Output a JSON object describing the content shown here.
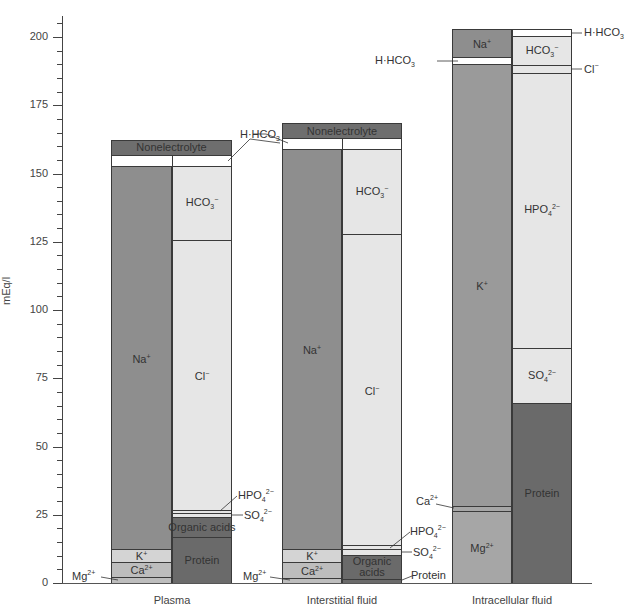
{
  "chart_data": {
    "type": "bar",
    "subtype": "stacked-gamble-diagram",
    "title": "",
    "xlabel": "",
    "ylabel": "mEq/l",
    "ylim": [
      0,
      200
    ],
    "yticks": [
      0,
      25,
      50,
      75,
      100,
      125,
      150,
      175,
      200
    ],
    "minor_tick_step": 5,
    "categories": [
      "Plasma",
      "Interstitial fluid",
      "Intracellular fluid"
    ],
    "columns": [
      {
        "name": "Plasma",
        "top_segments": [
          {
            "name": "Nonelectrolyte",
            "from": 156.8,
            "to": 162.3
          },
          {
            "name": "H·HCO3",
            "from": 152.7,
            "to": 156.8
          }
        ],
        "cations": [
          {
            "name": "Mg2+",
            "from": 0,
            "to": 2.2
          },
          {
            "name": "Ca2+",
            "from": 2.2,
            "to": 7.7
          },
          {
            "name": "K+",
            "from": 7.7,
            "to": 12.5
          },
          {
            "name": "Na+",
            "from": 12.5,
            "to": 152.7
          }
        ],
        "anions": [
          {
            "name": "Protein",
            "from": 0,
            "to": 16.8
          },
          {
            "name": "Organic acids",
            "from": 16.8,
            "to": 24.2
          },
          {
            "name": "SO4 2-",
            "from": 24.2,
            "to": 25.6
          },
          {
            "name": "HPO4 2-",
            "from": 25.6,
            "to": 26.7
          },
          {
            "name": "Cl-",
            "from": 26.7,
            "to": 125.6
          },
          {
            "name": "HCO3-",
            "from": 125.6,
            "to": 152.7
          }
        ]
      },
      {
        "name": "Interstitial fluid",
        "top_segments": [
          {
            "name": "Nonelectrolyte",
            "from": 163.0,
            "to": 168.5
          },
          {
            "name": "H·HCO3",
            "from": 159.0,
            "to": 163.0
          }
        ],
        "cations": [
          {
            "name": "Mg2+",
            "from": 0,
            "to": 1.8
          },
          {
            "name": "Ca2+",
            "from": 1.8,
            "to": 7.7
          },
          {
            "name": "K+",
            "from": 7.7,
            "to": 12.5
          },
          {
            "name": "Na+",
            "from": 12.5,
            "to": 159.0
          }
        ],
        "anions": [
          {
            "name": "Protein",
            "from": 0,
            "to": 1.5
          },
          {
            "name": "Organic acids",
            "from": 1.5,
            "to": 10.3
          },
          {
            "name": "SO4 2-",
            "from": 10.3,
            "to": 12.5
          },
          {
            "name": "HPO4 2-",
            "from": 12.5,
            "to": 13.9
          },
          {
            "name": "Cl-",
            "from": 13.9,
            "to": 127.8
          },
          {
            "name": "HCO3-",
            "from": 127.8,
            "to": 159.0
          }
        ]
      },
      {
        "name": "Intracellular fluid",
        "top_segments": [],
        "cations": [
          {
            "name": "Mg2+",
            "from": 0,
            "to": 26.4
          },
          {
            "name": "Ca2+",
            "from": 26.4,
            "to": 28.2
          },
          {
            "name": "K+",
            "from": 28.2,
            "to": 190.1
          },
          {
            "name": "H·HCO3",
            "from": 190.1,
            "to": 192.7
          },
          {
            "name": "Na+",
            "from": 192.7,
            "to": 202.9
          }
        ],
        "anions": [
          {
            "name": "Protein",
            "from": 0,
            "to": 65.9
          },
          {
            "name": "SO4 2-",
            "from": 65.9,
            "to": 86.1
          },
          {
            "name": "HPO4 2-",
            "from": 86.1,
            "to": 186.8
          },
          {
            "name": "Cl-",
            "from": 186.8,
            "to": 189.7
          },
          {
            "name": "HCO3-",
            "from": 189.7,
            "to": 200.4
          },
          {
            "name": "H·HCO3",
            "from": 200.4,
            "to": 202.9
          }
        ]
      }
    ],
    "grid": false,
    "legend": "none; segments labeled inline and with leader lines"
  },
  "labels": {
    "ylabel": "mEq/l",
    "nonelectrolyte": "Nonelectrolyte",
    "hhco3": "H·HCO",
    "hhco3_sub": "3",
    "hco3": "HCO",
    "hco3_sub": "3",
    "hco3_sup": "−",
    "na": "Na",
    "na_sup": "+",
    "k": "K",
    "k_sup": "+",
    "ca": "Ca",
    "ca_sup": "2+",
    "mg": "Mg",
    "mg_sup": "2+",
    "cl": "Cl",
    "cl_sup": "−",
    "hpo4": "HPO",
    "hpo4_sub": "4",
    "hpo4_sup": "2−",
    "so4": "SO",
    "so4_sub": "4",
    "so4_sup": "2−",
    "organic_acids": "Organic acids",
    "organic": "Organic",
    "acids": "acids",
    "protein": "Protein",
    "cat_plasma": "Plasma",
    "cat_interstitial": "Interstitial fluid",
    "cat_intracellular": "Intracellular fluid"
  },
  "colors": {
    "cation_dark": "#8e8e8e",
    "anion_light": "#e6e6e6",
    "protein_dark": "#6a6a6a",
    "nonelectrolyte": "#6e6e6e",
    "white": "#ffffff",
    "light_cation": "#d4d4d4",
    "mid_cation": "#bdbdbd",
    "intracell_k": "#9a9a9a",
    "intracell_mg": "#a6a6a6",
    "line": "#3a3a3a"
  }
}
